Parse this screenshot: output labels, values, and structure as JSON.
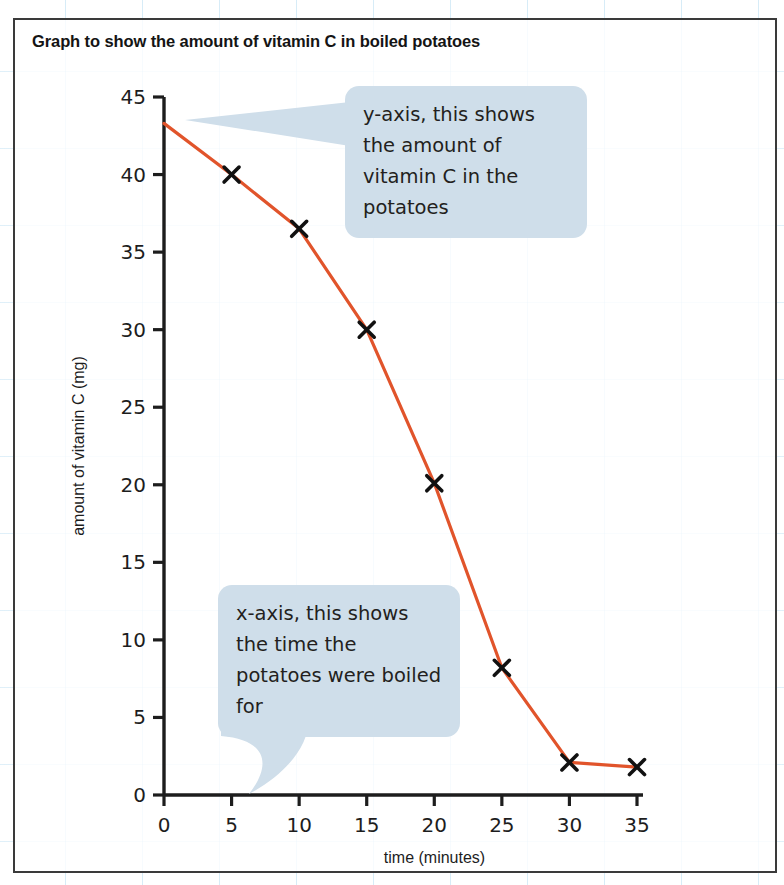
{
  "page": {
    "title": "Graph to show the amount of vitamin C in boiled potatoes"
  },
  "callouts": [
    {
      "id": "y-axis-callout",
      "text": "y-axis, this shows the amount of vitamin C in the potatoes"
    },
    {
      "id": "x-axis-callout",
      "text": "x-axis, this shows the time the potatoes were boiled for"
    }
  ],
  "colors": {
    "line": "#e1542b",
    "marker": "#111111",
    "axis": "#1d1d1d",
    "callout_bubble": "#cfdeea",
    "grid_blue": "#96cdeb",
    "border": "#3a3a3a"
  },
  "chart_data": {
    "type": "line",
    "title": "Graph to show the amount of vitamin C in boiled potatoes",
    "xlabel": "time (minutes)",
    "ylabel": "amount of vitamin C (mg)",
    "xlim": [
      0,
      35
    ],
    "ylim": [
      0,
      45
    ],
    "xticks": [
      0,
      5,
      10,
      15,
      20,
      25,
      30,
      35
    ],
    "yticks": [
      0,
      5,
      10,
      15,
      20,
      25,
      30,
      35,
      40,
      45
    ],
    "xtick_labels": [
      "0",
      "5",
      "10",
      "15",
      "20",
      "25",
      "30",
      "35"
    ],
    "ytick_labels": [
      "0",
      "5",
      "10",
      "15",
      "20",
      "25",
      "30",
      "35",
      "40",
      "45"
    ],
    "grid": false,
    "legend": null,
    "markers": "x",
    "series": [
      {
        "name": "vitamin C in boiled potatoes",
        "color": "#e1542b",
        "x": [
          0,
          5,
          10,
          15,
          20,
          25,
          30,
          35
        ],
        "values": [
          43.3,
          40.0,
          36.5,
          30.0,
          20.1,
          8.2,
          2.1,
          1.8
        ],
        "marker_at_first_point": false
      }
    ]
  }
}
